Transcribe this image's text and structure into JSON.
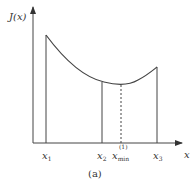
{
  "diagram": {
    "y_axis_label": "J(x)",
    "x_axis_label": "x",
    "ticks": [
      {
        "name": "x",
        "sub": "1",
        "sup": ""
      },
      {
        "name": "x",
        "sub": "2",
        "sup": ""
      },
      {
        "name": "x",
        "sub": "min",
        "sup": "(1)"
      },
      {
        "name": "x",
        "sub": "3",
        "sup": ""
      }
    ],
    "caption": "(a)",
    "colors": {
      "line": "#444444",
      "background": "#ffffff"
    }
  }
}
